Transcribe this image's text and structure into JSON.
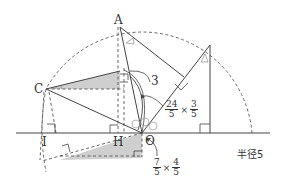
{
  "diagram": {
    "type": "geometry",
    "points": {
      "A": "A",
      "C": "C",
      "H": "H",
      "I": "I",
      "O": "O"
    },
    "labels": {
      "side_length": "3",
      "radius_label": "半径5"
    },
    "fractions": {
      "upper": {
        "a_num": "24",
        "a_den": "5",
        "times": "×",
        "b_num": "3",
        "b_den": "5"
      },
      "lower": {
        "a_num": "7",
        "a_den": "5",
        "times": "×",
        "b_num": "4",
        "b_den": "5"
      }
    },
    "colors": {
      "line": "#333333",
      "dashed": "#555555",
      "shade": "#cfcfcf",
      "background": "#ffffff"
    }
  }
}
